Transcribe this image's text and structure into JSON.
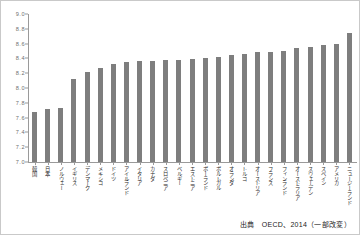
{
  "chart_data": {
    "type": "bar",
    "title": "",
    "subtitle": "",
    "xlabel": "",
    "ylabel": "",
    "ylim": [
      7.0,
      9.0
    ],
    "ytick_step": 0.2,
    "yticks": [
      "9.0",
      "8.8",
      "8.6",
      "8.4",
      "8.2",
      "8.0",
      "7.8",
      "7.6",
      "7.4",
      "7.2",
      "7.0"
    ],
    "grid": false,
    "legend": null,
    "bar_color": "#7e7e7e",
    "axis_color": "#9a9a9a",
    "categories": [
      "韓国",
      "日本",
      "ノルウェー",
      "イギリス",
      "デンマーク",
      "メキシコ",
      "ドイツ",
      "アイルランド",
      "イタリア",
      "カナダ",
      "スロベニア",
      "ベルギー",
      "エストニア",
      "ポーランド",
      "ポルトガル",
      "オランダ",
      "トルコ",
      "オーストリア",
      "フランス",
      "フィンランド",
      "オーストラリア",
      "スウェーデン",
      "スペイン",
      "アメリカ",
      "ニュージーランド"
    ],
    "values": [
      7.68,
      7.72,
      7.73,
      8.12,
      8.22,
      8.27,
      8.33,
      8.35,
      8.36,
      8.37,
      8.38,
      8.38,
      8.39,
      8.4,
      8.42,
      8.44,
      8.46,
      8.48,
      8.49,
      8.5,
      8.54,
      8.56,
      8.58,
      8.6,
      8.75
    ]
  },
  "caption": {
    "source_text": "出典　OECD、2014（一部改変）"
  }
}
